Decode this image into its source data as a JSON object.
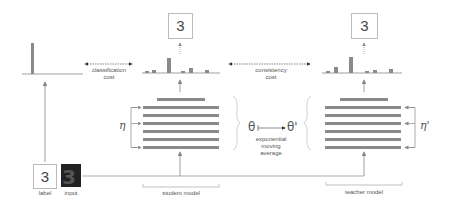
{
  "diagram": {
    "colors": {
      "bar": "#8a8a8a",
      "line": "#888888",
      "text": "#555555"
    },
    "labels": {
      "classification_cost": [
        "classification",
        "cost"
      ],
      "consistency_cost": [
        "consistency",
        "cost"
      ],
      "ema": [
        "exponential",
        "moving",
        "average"
      ],
      "student_model": "student model",
      "teacher_model": "teacher model",
      "label": "label",
      "input": "input",
      "eta": "η",
      "eta_prime": "η'",
      "theta": "θ",
      "theta_prime": "θ'"
    },
    "predictions": {
      "student": "3",
      "teacher": "3",
      "label": "3"
    },
    "distributions": {
      "target_one_hot": [
        0,
        0,
        0,
        1,
        0,
        0,
        0,
        0,
        0,
        0
      ],
      "student": [
        0.05,
        0.15,
        0.03,
        0.6,
        0.03,
        0.2,
        0.03,
        0.15,
        0.03,
        0.02
      ],
      "teacher": [
        0.05,
        0.2,
        0.03,
        0.65,
        0.03,
        0.05,
        0.08,
        0.03,
        0.12,
        0.02
      ]
    }
  }
}
